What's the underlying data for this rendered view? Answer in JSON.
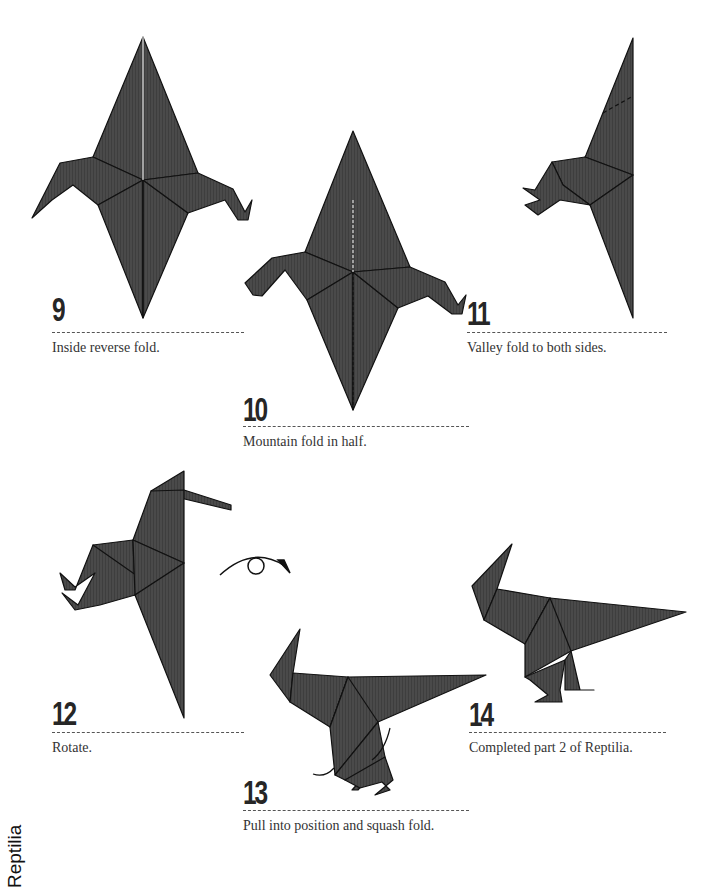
{
  "page": {
    "section_label": "Reptilia",
    "paper_color": "#4a4a4a",
    "line_color": "#111111"
  },
  "steps": [
    {
      "number": "9",
      "caption": "Inside reverse fold."
    },
    {
      "number": "10",
      "caption": "Mountain fold in half."
    },
    {
      "number": "11",
      "caption": "Valley fold to both sides."
    },
    {
      "number": "12",
      "caption": "Rotate."
    },
    {
      "number": "13",
      "caption": "Pull into position and squash fold."
    },
    {
      "number": "14",
      "caption": "Completed part 2 of Reptilia."
    }
  ],
  "icons": {
    "rotate": "rotate-arrow-icon",
    "pull": "curved-arrow-icon"
  }
}
